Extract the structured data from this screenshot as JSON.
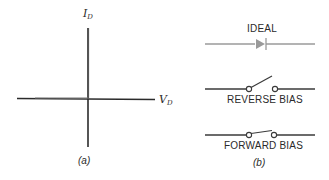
{
  "panel_a": {
    "y_axis_label": "I",
    "y_axis_sub": "D",
    "x_axis_label": "V",
    "x_axis_sub": "D",
    "caption": "(a)"
  },
  "panel_b": {
    "ideal_label": "IDEAL",
    "reverse_label": "REVERSE BIAS",
    "forward_label": "FORWARD BIAS",
    "caption": "(b)",
    "colors": {
      "ideal_symbol": "#9a9a9a",
      "switch_lines": "#3a3a3a"
    }
  }
}
